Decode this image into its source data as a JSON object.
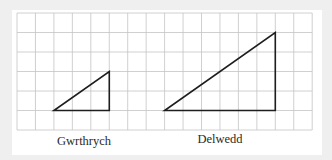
{
  "figure": {
    "background_color": "#efefef",
    "panel_color": "#ffffff",
    "grid": {
      "columns": 16,
      "rows": 6,
      "origin_x": 17,
      "origin_y": 13,
      "cell_width": 18.45,
      "cell_height": 19.5,
      "line_color": "#c4c4c4"
    },
    "shapes": [
      {
        "name": "object-triangle",
        "label": "Gwrthrych",
        "grid_vertices": [
          [
            2,
            5
          ],
          [
            5,
            5
          ],
          [
            5,
            3
          ]
        ],
        "width_cells": 3,
        "height_cells": 2
      },
      {
        "name": "image-triangle",
        "label": "Delwedd",
        "grid_vertices": [
          [
            8,
            5
          ],
          [
            14,
            5
          ],
          [
            14,
            1
          ]
        ],
        "width_cells": 6,
        "height_cells": 4
      }
    ],
    "labels": {
      "object": "Gwrthrych",
      "image": "Delwedd"
    },
    "scale_factor": 2
  }
}
